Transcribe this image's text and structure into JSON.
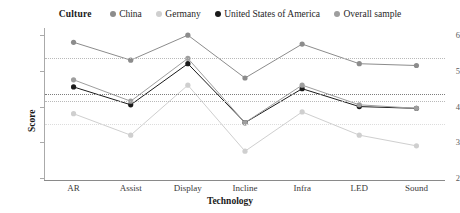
{
  "legend": {
    "title": "Culture",
    "items": [
      {
        "label": "China",
        "color": "#8c8c8c",
        "icon": "legend-dot-icon"
      },
      {
        "label": "Germany",
        "color": "#cfcfcf",
        "icon": "legend-dot-icon"
      },
      {
        "label": "United States of America",
        "color": "#1a1a1a",
        "icon": "legend-dot-icon"
      },
      {
        "label": "Overall sample",
        "color": "#9e9e9e",
        "icon": "legend-dot-icon"
      }
    ]
  },
  "axes": {
    "ylabel": "Score",
    "xlabel": "Technology",
    "yticks": [
      "2",
      "3",
      "4",
      "5",
      "6"
    ],
    "xticks": [
      "AR",
      "Assist",
      "Display",
      "Incline",
      "Infra",
      "LED",
      "Sound"
    ]
  },
  "chart_data": {
    "type": "line",
    "title": "",
    "xlabel": "Technology",
    "ylabel": "Score",
    "categories": [
      "AR",
      "Assist",
      "Display",
      "Incline",
      "Infra",
      "LED",
      "Sound"
    ],
    "ylim": [
      2,
      6.2
    ],
    "yticks": [
      2,
      3,
      4,
      5,
      6
    ],
    "grid": true,
    "gridlines": [
      5.35,
      4.35,
      4.15,
      3.5
    ],
    "legend_position": "top-center",
    "legend_title": "Culture",
    "series": [
      {
        "name": "China",
        "color": "#8c8c8c",
        "values": [
          5.8,
          5.3,
          6.0,
          4.8,
          5.75,
          5.2,
          5.15
        ]
      },
      {
        "name": "Germany",
        "color": "#cfcfcf",
        "values": [
          3.8,
          3.2,
          4.6,
          2.75,
          3.85,
          3.2,
          2.9
        ]
      },
      {
        "name": "United States of America",
        "color": "#1a1a1a",
        "values": [
          4.55,
          4.05,
          5.2,
          3.55,
          4.5,
          4.0,
          3.95
        ]
      },
      {
        "name": "Overall sample",
        "color": "#9e9e9e",
        "values": [
          4.75,
          4.15,
          5.35,
          3.55,
          4.6,
          4.05,
          3.95
        ]
      }
    ]
  }
}
